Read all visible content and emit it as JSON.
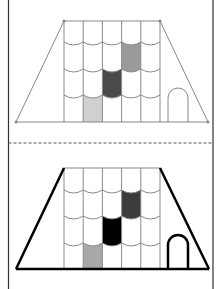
{
  "figure": {
    "width": 217,
    "height": 289,
    "border_color": "#333333",
    "divider_color": "#555555",
    "panels": [
      {
        "id": "top",
        "style": "thin",
        "stroke": "#888888",
        "outline_width": 1,
        "trapezoid": {
          "top_y": 21,
          "base_y": 122,
          "top_left_x": 64,
          "top_right_x": 160,
          "base_left_x": 16,
          "base_right_x": 208
        },
        "vertex_dots": true,
        "grid": {
          "left_x": 64,
          "right_x": 160,
          "columns": 5,
          "row_lines_y": [
            45,
            72,
            98
          ]
        },
        "filled_tiles": [
          {
            "col": 3,
            "row": 1,
            "color": "#9a9a9a"
          },
          {
            "col": 2,
            "row": 2,
            "color": "#4a4a4a"
          },
          {
            "col": 1,
            "row": 3,
            "color": "#d0d0d0"
          }
        ],
        "door": {
          "left_x": 168,
          "right_x": 188,
          "top_y": 88,
          "base_y": 122,
          "stroke": "#888888",
          "width": 1
        }
      },
      {
        "id": "bottom",
        "style": "bold",
        "stroke": "#000000",
        "outline_width": 2.5,
        "trapezoid": {
          "top_y": 168,
          "base_y": 269,
          "top_left_x": 64,
          "top_right_x": 160,
          "base_left_x": 16,
          "base_right_x": 209
        },
        "vertex_dots": false,
        "grid": {
          "left_x": 64,
          "right_x": 160,
          "columns": 5,
          "row_lines_y": [
            193,
            219,
            246
          ]
        },
        "filled_tiles": [
          {
            "col": 3,
            "row": 1,
            "color": "#3c3c3c"
          },
          {
            "col": 2,
            "row": 2,
            "color": "#000000"
          },
          {
            "col": 1,
            "row": 3,
            "color": "#a8a8a8"
          }
        ],
        "door": {
          "left_x": 168,
          "right_x": 188,
          "top_y": 235,
          "base_y": 269,
          "stroke": "#000000",
          "width": 2.5
        }
      }
    ],
    "divider_y": 143
  }
}
